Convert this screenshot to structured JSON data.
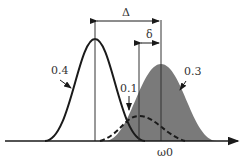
{
  "diagram": {
    "labels": {
      "delta_big": "Δ",
      "delta_small": "δ",
      "left_curve": "0.4",
      "dashed_curve": "0.1",
      "gray_curve": "0.3",
      "axis": "ω0"
    },
    "colors": {
      "line": "#1a1a1a",
      "fill": "#7a7a7a"
    }
  }
}
